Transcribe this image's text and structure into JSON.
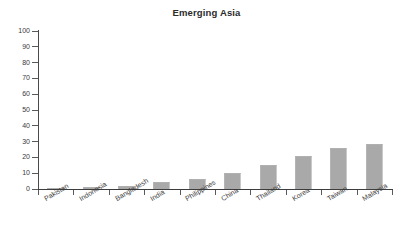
{
  "chart_data": {
    "type": "bar",
    "title": "Emerging Asia",
    "xlabel": "",
    "ylabel": "",
    "ylim": [
      0,
      100
    ],
    "yticks": [
      0,
      10,
      20,
      30,
      40,
      50,
      60,
      70,
      80,
      90,
      100
    ],
    "grid": false,
    "legend": false,
    "legend_position": "none",
    "bar_color": "#a9a9a9",
    "categories": [
      "Pakistan",
      "Indonesia",
      "Bangladesh",
      "India",
      "Philippines",
      "China",
      "Thailand",
      "Korea",
      "Taiwan",
      "Malaysia"
    ],
    "values": [
      0.5,
      1.5,
      2,
      4.5,
      6.5,
      10,
      15.5,
      21,
      26,
      28.5
    ]
  },
  "colors": {
    "bar_fill": "#a9a9a9",
    "axis": "#4a4a4a",
    "text": "#3a3a3a",
    "title": "#2b2b2b",
    "background": "#ffffff"
  }
}
